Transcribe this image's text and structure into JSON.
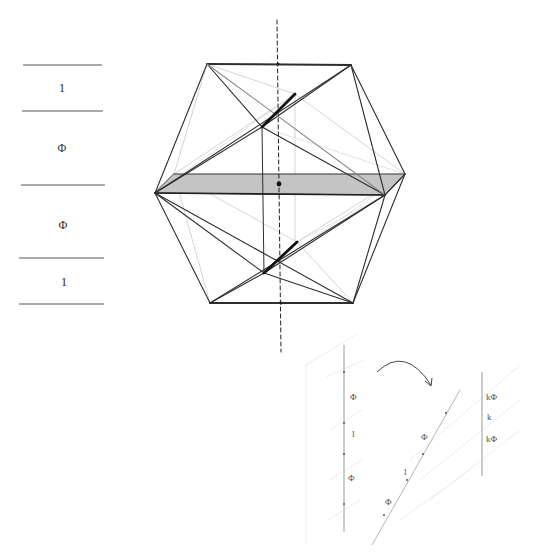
{
  "figure": {
    "colors": {
      "edge_dark": "#2a2a2a",
      "edge_hidden": "#c8c8c8",
      "plane_fill": "#c4c4c4",
      "scale_line": "#666666",
      "faint": "#e6e6e6"
    }
  },
  "scale": {
    "segments": [
      {
        "label": "1"
      },
      {
        "label": "Φ"
      },
      {
        "label": "Φ"
      },
      {
        "label": "1"
      }
    ]
  },
  "icosahedron": {
    "axis_style": "dashed",
    "center_dot": true
  },
  "projection": {
    "vertical_labels": [
      "Φ",
      "1",
      "Φ"
    ],
    "diagonal_labels": [
      "Φ",
      "1",
      "Φ"
    ],
    "right_labels": [
      "kΦ",
      "k",
      "kΦ"
    ],
    "arrow": "curved-rotation-arrow"
  }
}
